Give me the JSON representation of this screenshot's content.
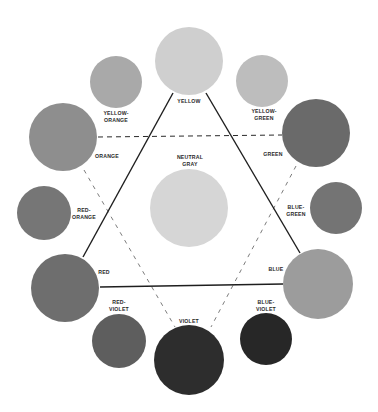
{
  "diagram": {
    "title": "",
    "center": {
      "name": "neutral-gray",
      "label_lines": [
        "NEUTRAL",
        "GRAY"
      ],
      "cx": 189,
      "cy": 208,
      "r": 39,
      "color": "#d6d6d6",
      "label_x": 190,
      "label_y": 159
    },
    "swatches": [
      {
        "name": "yellow",
        "label_lines": [
          "YELLOW"
        ],
        "cx": 189,
        "cy": 61,
        "r": 34,
        "color": "#cfcfcf",
        "label_x": 189,
        "label_y": 103
      },
      {
        "name": "yellow-orange",
        "label_lines": [
          "YELLOW-",
          "ORANGE"
        ],
        "cx": 116,
        "cy": 82,
        "r": 26,
        "color": "#a9a9a9",
        "label_x": 116,
        "label_y": 115
      },
      {
        "name": "yellow-green",
        "label_lines": [
          "YELLOW-",
          "GREEN"
        ],
        "cx": 262,
        "cy": 81,
        "r": 26,
        "color": "#bdbdbd",
        "label_x": 264,
        "label_y": 113
      },
      {
        "name": "orange",
        "label_lines": [
          "ORANGE"
        ],
        "cx": 63,
        "cy": 137,
        "r": 34,
        "color": "#8e8e8e",
        "label_x": 107,
        "label_y": 158
      },
      {
        "name": "green",
        "label_lines": [
          "GREEN"
        ],
        "cx": 316,
        "cy": 133,
        "r": 34,
        "color": "#6a6a6a",
        "label_x": 273,
        "label_y": 156
      },
      {
        "name": "red-orange",
        "label_lines": [
          "RED-",
          "ORANGE"
        ],
        "cx": 44,
        "cy": 213,
        "r": 27,
        "color": "#767676",
        "label_x": 84,
        "label_y": 212
      },
      {
        "name": "blue-green",
        "label_lines": [
          "BLUE-",
          "GREEN"
        ],
        "cx": 336,
        "cy": 208,
        "r": 26,
        "color": "#747474",
        "label_x": 296,
        "label_y": 209
      },
      {
        "name": "red",
        "label_lines": [
          "RED"
        ],
        "cx": 65,
        "cy": 288,
        "r": 34,
        "color": "#6e6e6e",
        "label_x": 104,
        "label_y": 274
      },
      {
        "name": "blue",
        "label_lines": [
          "BLUE"
        ],
        "cx": 318,
        "cy": 284,
        "r": 35,
        "color": "#9c9c9c",
        "label_x": 276,
        "label_y": 271
      },
      {
        "name": "red-violet",
        "label_lines": [
          "RED-",
          "VIOLET"
        ],
        "cx": 119,
        "cy": 341,
        "r": 27,
        "color": "#5e5e5e",
        "label_x": 119,
        "label_y": 304
      },
      {
        "name": "violet",
        "label_lines": [
          "VIOLET"
        ],
        "cx": 189,
        "cy": 360,
        "r": 35,
        "color": "#2d2d2d",
        "label_x": 189,
        "label_y": 323
      },
      {
        "name": "blue-violet",
        "label_lines": [
          "BLUE-",
          "VIOLET"
        ],
        "cx": 266,
        "cy": 339,
        "r": 26,
        "color": "#272727",
        "label_x": 266,
        "label_y": 304
      }
    ],
    "primary_triangle": {
      "style": "solid",
      "points": [
        [
          173,
          92
        ],
        [
          206,
          92
        ],
        [
          83,
          257
        ],
        [
          300,
          253
        ],
        [
          101,
          287
        ],
        [
          283,
          285
        ]
      ],
      "segments": [
        {
          "x1": 173,
          "y1": 93,
          "x2": 83,
          "y2": 257
        },
        {
          "x1": 206,
          "y1": 93,
          "x2": 300,
          "y2": 253
        },
        {
          "x1": 100,
          "y1": 287,
          "x2": 283,
          "y2": 284
        }
      ]
    },
    "secondary_triangle": {
      "style": "dashed",
      "segments": [
        {
          "x1": 98,
          "y1": 137,
          "x2": 282,
          "y2": 135,
          "weight": "heavy"
        },
        {
          "x1": 84,
          "y1": 170,
          "x2": 175,
          "y2": 327,
          "weight": "light"
        },
        {
          "x1": 296,
          "y1": 166,
          "x2": 211,
          "y2": 327,
          "weight": "light"
        }
      ]
    }
  }
}
